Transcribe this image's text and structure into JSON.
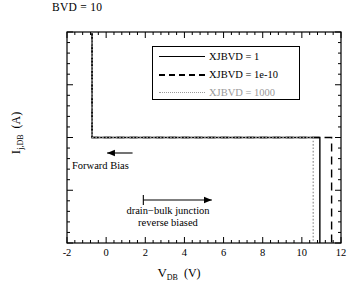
{
  "chart_data": {
    "type": "line",
    "title": "BVD  = 10",
    "xlabel": "V_DB (V)",
    "ylabel": "I_j,DB (A)",
    "xlim": [
      -2,
      12
    ],
    "ylim": [
      -0.0001,
      0.0001
    ],
    "grid": false,
    "legend_position": "upper-center",
    "xticks": [
      -2,
      0,
      2,
      4,
      6,
      8,
      10,
      12
    ],
    "xticklabels": [
      "-2",
      "0",
      "2",
      "4",
      "6",
      "8",
      "10",
      "12"
    ],
    "xminor_per_major": 4,
    "yticks": [
      0.0001,
      5e-05,
      0,
      -5e-05,
      -0.0001
    ],
    "yticklabels": [
      "10⁻⁴",
      "5 × 10⁻⁵",
      "0",
      "-5 × 10⁻⁵",
      "- 10⁻⁴"
    ],
    "yminor_per_major": 4,
    "series": [
      {
        "name": "XJBVD  = 1",
        "style": "solid",
        "color": "#000000",
        "forward_turn_on_v": -0.72,
        "breakdown_v": 10.92,
        "points": [
          [
            -0.72,
            0.0001
          ],
          [
            -0.72,
            0.0
          ],
          [
            10.92,
            0.0
          ],
          [
            10.92,
            -0.0001
          ]
        ]
      },
      {
        "name": "XJBVD  = 1e-10",
        "style": "dashed",
        "color": "#000000",
        "forward_turn_on_v": -0.72,
        "breakdown_v": 11.52,
        "points": [
          [
            -0.72,
            0.0001
          ],
          [
            -0.72,
            0.0
          ],
          [
            11.52,
            0.0
          ],
          [
            11.52,
            -0.0001
          ]
        ]
      },
      {
        "name": "XJBVD  = 1000",
        "style": "dotted",
        "color": "#9a9a9a",
        "forward_turn_on_v": -0.72,
        "breakdown_v": 10.58,
        "points": [
          [
            -0.72,
            0.0001
          ],
          [
            -0.72,
            0.0
          ],
          [
            10.58,
            0.0
          ],
          [
            10.58,
            -0.0001
          ]
        ]
      }
    ],
    "annotations": [
      {
        "text": "Forward Bias",
        "arrow": "left",
        "x": 0.35,
        "y": -1.8e-05
      },
      {
        "text_line1": "drain−bulk junction",
        "text_line2": "reverse biased",
        "arrow": "right",
        "x": 3.1,
        "y": -5e-05
      }
    ]
  }
}
